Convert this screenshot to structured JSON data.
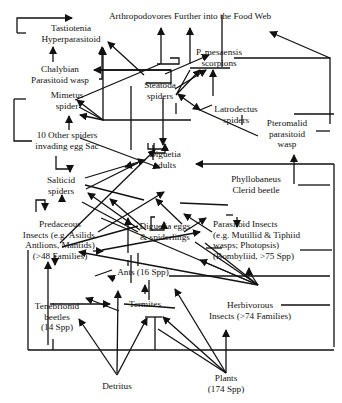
{
  "diagram": {
    "type": "food-web",
    "nodes": [
      {
        "id": "top",
        "lines": [
          "Arthropodovores Further into the Food Web"
        ],
        "x": 190,
        "y": 19,
        "anchor": "middle"
      },
      {
        "id": "tastiotenia",
        "lines": [
          "Tastiotenia",
          "Hyperparasitoid"
        ],
        "x": 71,
        "y": 31
      },
      {
        "id": "mesaensis",
        "lines": [
          "P. mesaensis",
          "scorpions"
        ],
        "x": 219,
        "y": 55
      },
      {
        "id": "chalybian",
        "lines": [
          "Chalybian",
          "Parasitoid wasp"
        ],
        "x": 60,
        "y": 72
      },
      {
        "id": "steatoda",
        "lines": [
          "Steatoda",
          "spiders"
        ],
        "x": 160,
        "y": 88
      },
      {
        "id": "mimetus",
        "lines": [
          "Mimetus",
          "spider"
        ],
        "x": 67,
        "y": 98
      },
      {
        "id": "latrodectus",
        "lines": [
          "Latrodectus",
          "spiders"
        ],
        "x": 236,
        "y": 112
      },
      {
        "id": "pteromalid",
        "lines": [
          "Pteromalid",
          "parasitoid",
          "wasp"
        ],
        "x": 287,
        "y": 126
      },
      {
        "id": "other_spiders",
        "lines": [
          "10 Other spiders",
          "invading egg Sac"
        ],
        "x": 67,
        "y": 138
      },
      {
        "id": "diguetia_adults",
        "lines": [
          "Diguetia",
          "adults"
        ],
        "x": 165,
        "y": 157
      },
      {
        "id": "phyllobaneus",
        "lines": [
          "Phyllobaneus",
          "Clerid beetle"
        ],
        "x": 256,
        "y": 182
      },
      {
        "id": "salticid",
        "lines": [
          "Salticid",
          "spiders"
        ],
        "x": 61,
        "y": 183
      },
      {
        "id": "diguetia_eggs",
        "lines": [
          "Diguetia eggs",
          "& spiderlings"
        ],
        "x": 165,
        "y": 229
      },
      {
        "id": "parasitoid_insects",
        "lines": [
          "Parasitoid Insects",
          "(e.g. Mutillid & Tiphiid",
          "wasps; Photopsis)",
          "(Bombyliid, >75 Spp)"
        ],
        "x": 213,
        "y": 227,
        "anchor": "start"
      },
      {
        "id": "predaceous",
        "lines": [
          "Predaceous",
          "Insects (e.g. Asilids,",
          "Antlions, Mantids)",
          "(>48 Families)"
        ],
        "x": 60,
        "y": 227
      },
      {
        "id": "ants",
        "lines": [
          "Ants (16 Spp)"
        ],
        "x": 143,
        "y": 275
      },
      {
        "id": "tenebrionid",
        "lines": [
          "Tenebrionid",
          "beetles",
          "(14 Spp)"
        ],
        "x": 57,
        "y": 309
      },
      {
        "id": "termites",
        "lines": [
          "Termites"
        ],
        "x": 145,
        "y": 307
      },
      {
        "id": "herbivorous",
        "lines": [
          "Herbivorous",
          "Insects (>74 Families)"
        ],
        "x": 250,
        "y": 308
      },
      {
        "id": "detritus",
        "lines": [
          "Detritus"
        ],
        "x": 117,
        "y": 389
      },
      {
        "id": "plants",
        "lines": [
          "Plants",
          "(174 Spp)"
        ],
        "x": 226,
        "y": 381
      }
    ],
    "edges": [
      {
        "d": "M17,33 L17,18 L72,18",
        "arrow": true
      },
      {
        "d": "M17,33 L26,33",
        "arrow": false
      },
      {
        "d": "M53,62 L53,47",
        "arrow": true
      },
      {
        "d": "M222,67 L222,15",
        "arrow": false
      },
      {
        "d": "M170,58 L179,58 L179,64 L157,64",
        "arrow": false
      },
      {
        "d": "M190,64 L190,28",
        "arrow": true
      },
      {
        "d": "M161,64 L161,28",
        "arrow": true
      },
      {
        "d": "M190,68 L230,68",
        "arrow": false
      },
      {
        "d": "M175,89 L206,70",
        "arrow": true
      },
      {
        "d": "M165,74 L209,55",
        "arrow": true
      },
      {
        "d": "M144,75 L108,42",
        "arrow": true
      },
      {
        "d": "M97,70 L171,70 L171,83 L146,83",
        "arrow": false
      },
      {
        "d": "M171,70 L94,70",
        "arrow": true
      },
      {
        "d": "M75,100 L160,64",
        "arrow": false
      },
      {
        "d": "M99,79 L102,79 L102,47",
        "arrow": true
      },
      {
        "d": "M79,107 L103,120 L103,48",
        "arrow": true
      },
      {
        "d": "M103,120 L77,100",
        "arrow": true
      },
      {
        "d": "M103,120 L80,115",
        "arrow": true
      },
      {
        "d": "M103,120 L191,120",
        "arrow": false
      },
      {
        "d": "M131,86 L131,150",
        "arrow": false
      },
      {
        "d": "M190,70 L176,95 L200,70",
        "arrow": true
      },
      {
        "d": "M163,98 L163,145",
        "arrow": true
      },
      {
        "d": "M176,114 L176,103",
        "arrow": false
      },
      {
        "d": "M186,100 L200,110",
        "arrow": true
      },
      {
        "d": "M186,100 L178,94",
        "arrow": true
      },
      {
        "d": "M213,96 L213,70",
        "arrow": true
      },
      {
        "d": "M242,125 L242,115",
        "arrow": false
      },
      {
        "d": "M234,58 L330,58 L330,124",
        "arrow": false
      },
      {
        "d": "M330,58 L270,32",
        "arrow": true
      },
      {
        "d": "M334,114 L294,114",
        "arrow": false
      },
      {
        "d": "M258,136 L200,110 L212,105",
        "arrow": false
      },
      {
        "d": "M316,131 L330,131",
        "arrow": false
      },
      {
        "d": "M334,164 L196,164",
        "arrow": true
      },
      {
        "d": "M294,184 L294,155",
        "arrow": true
      },
      {
        "d": "M298,185 L330,185",
        "arrow": false
      },
      {
        "d": "M334,164 L334,347",
        "arrow": false
      },
      {
        "d": "M14,99 L26,99",
        "arrow": false
      },
      {
        "d": "M14,99 L14,120",
        "arrow": false
      },
      {
        "d": "M14,120 L14,141 L32,141",
        "arrow": false
      },
      {
        "d": "M69,130 L69,116",
        "arrow": true
      },
      {
        "d": "M80,138 L160,168",
        "arrow": true
      },
      {
        "d": "M56,156 L56,169 L70,169 L70,172",
        "arrow": true
      },
      {
        "d": "M85,178 L145,160",
        "arrow": true
      },
      {
        "d": "M85,185 L144,200",
        "arrow": false
      },
      {
        "d": "M86,189 L138,163 L125,167",
        "arrow": true
      },
      {
        "d": "M154,143 L154,153 L165,153 L165,144",
        "arrow": true
      },
      {
        "d": "M153,145 L153,160",
        "arrow": false
      },
      {
        "d": "M148,143 L148,149 L168,149",
        "arrow": false
      },
      {
        "d": "M62,202 L62,195",
        "arrow": true
      },
      {
        "d": "M36,212 L36,200 L45,200 L45,210",
        "arrow": true
      },
      {
        "d": "M155,217 L151,217 L151,230 L164,230 L164,222",
        "arrow": true
      },
      {
        "d": "M140,230 L88,193",
        "arrow": true
      },
      {
        "d": "M138,232 L82,202",
        "arrow": false
      },
      {
        "d": "M146,230 L110,199",
        "arrow": true
      },
      {
        "d": "M184,232 L206,218",
        "arrow": true
      },
      {
        "d": "M182,224 L156,199",
        "arrow": true
      },
      {
        "d": "M212,232 L184,214",
        "arrow": true
      },
      {
        "d": "M228,205 L180,203",
        "arrow": false
      },
      {
        "d": "M237,217 L237,227",
        "arrow": true
      },
      {
        "d": "M233,215 L226,215",
        "arrow": false
      },
      {
        "d": "M62,247 L138,226",
        "arrow": false
      },
      {
        "d": "M98,232 L164,192",
        "arrow": true
      },
      {
        "d": "M102,250 L200,232",
        "arrow": true
      },
      {
        "d": "M60,243 L155,150",
        "arrow": true
      },
      {
        "d": "M128,253 L128,218",
        "arrow": true
      },
      {
        "d": "M131,255 L131,283",
        "arrow": false
      },
      {
        "d": "M128,260 L128,266",
        "arrow": false
      },
      {
        "d": "M138,253 L138,266",
        "arrow": false
      },
      {
        "d": "M93,251 L103,251",
        "arrow": true
      },
      {
        "d": "M206,248 L222,248",
        "arrow": false
      },
      {
        "d": "M332,250 L300,250",
        "arrow": false
      },
      {
        "d": "M95,276 L112,270",
        "arrow": false
      },
      {
        "d": "M115,279 L108,276",
        "arrow": true
      },
      {
        "d": "M169,276 L330,276",
        "arrow": false
      },
      {
        "d": "M249,276 L249,268",
        "arrow": true
      },
      {
        "d": "M258,285 L195,242",
        "arrow": false
      },
      {
        "d": "M258,285 L248,270",
        "arrow": false
      },
      {
        "d": "M258,285 L205,243",
        "arrow": false
      },
      {
        "d": "M258,285 L200,260",
        "arrow": true
      },
      {
        "d": "M258,285 L101,218",
        "arrow": false
      },
      {
        "d": "M258,285 L79,252",
        "arrow": true
      },
      {
        "d": "M145,294 L145,285",
        "arrow": true
      },
      {
        "d": "M149,300 L149,294 L149,280",
        "arrow": false
      },
      {
        "d": "M119,311 L86,298",
        "arrow": true
      },
      {
        "d": "M124,304 L175,308",
        "arrow": false
      },
      {
        "d": "M50,304 L110,304",
        "arrow": true
      },
      {
        "d": "M28,350 L28,250",
        "arrow": false
      },
      {
        "d": "M28,350 L334,350",
        "arrow": false
      },
      {
        "d": "M53,350 L53,339",
        "arrow": false
      },
      {
        "d": "M55,255 L55,265",
        "arrow": true
      },
      {
        "d": "M48,345 L48,262",
        "arrow": true
      },
      {
        "d": "M117,373 L118,291",
        "arrow": true
      },
      {
        "d": "M155,350 L155,317",
        "arrow": false
      },
      {
        "d": "M117,375 L79,319",
        "arrow": true
      },
      {
        "d": "M117,375 L147,318",
        "arrow": true
      },
      {
        "d": "M226,373 L163,317",
        "arrow": true
      },
      {
        "d": "M226,373 L175,289",
        "arrow": true
      },
      {
        "d": "M226,373 L158,329",
        "arrow": false
      },
      {
        "d": "M226,373 L226,330",
        "arrow": true
      },
      {
        "d": "M145,317 L162,317",
        "arrow": false
      },
      {
        "d": "M281,305 L330,305",
        "arrow": false
      }
    ]
  }
}
